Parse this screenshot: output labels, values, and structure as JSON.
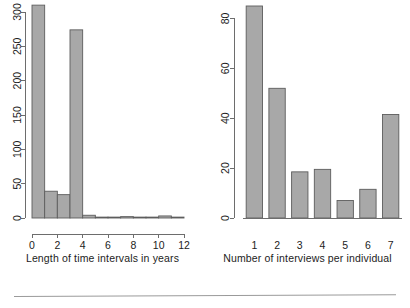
{
  "figure": {
    "background_color": "#ffffff",
    "bar_fill_color": "#a8a8a8",
    "bar_stroke_color": "#5d5d5d",
    "axis_color": "#6d6d6d",
    "footer_rule_color": "#9a9a9a"
  },
  "chart_data": [
    {
      "type": "bar",
      "title": "",
      "xlabel": "Length of time intervals in years",
      "ylabel": "",
      "xlim": [
        0,
        12
      ],
      "ylim": [
        0,
        310
      ],
      "xticks": [
        "0",
        "2",
        "4",
        "6",
        "8",
        "10",
        "12"
      ],
      "xtick_values": [
        0,
        2,
        4,
        6,
        8,
        10,
        12
      ],
      "yticks": [
        "0",
        "50",
        "100",
        "150",
        "200",
        "250",
        "300"
      ],
      "ytick_values": [
        0,
        50,
        100,
        150,
        200,
        250,
        300
      ],
      "grid": false,
      "legend": "none",
      "bin_width": 1,
      "bin_edges": [
        0,
        1,
        2,
        3,
        4,
        5,
        6,
        7,
        8,
        9,
        10,
        11,
        12
      ],
      "categories": [
        "0-1",
        "1-2",
        "2-3",
        "3-4",
        "4-5",
        "5-6",
        "6-7",
        "7-8",
        "8-9",
        "9-10",
        "10-11",
        "11-12"
      ],
      "values": [
        310,
        39,
        34,
        274,
        4,
        0,
        0,
        2,
        0,
        0,
        3,
        1
      ]
    },
    {
      "type": "bar",
      "title": "",
      "xlabel": "Number of interviews per individual",
      "ylabel": "",
      "xlim": [
        0.5,
        7.5
      ],
      "ylim": [
        0,
        85
      ],
      "xticks": [
        "1",
        "2",
        "3",
        "4",
        "5",
        "6",
        "7"
      ],
      "xtick_values": [
        1,
        2,
        3,
        4,
        5,
        6,
        7
      ],
      "yticks": [
        "0",
        "20",
        "40",
        "60",
        "80"
      ],
      "ytick_values": [
        0,
        20,
        40,
        60,
        80
      ],
      "grid": false,
      "legend": "none",
      "note": "first bar is clipped at the top edge of the figure",
      "categories": [
        "1",
        "2",
        "3",
        "4",
        "5",
        "6",
        "7"
      ],
      "values": [
        85,
        52,
        18.5,
        19.5,
        7,
        11.5,
        41.5
      ]
    }
  ],
  "panels": {
    "left": {
      "name": "length-of-time-intervals-histogram",
      "axis_title": "Length of time intervals in years"
    },
    "right": {
      "name": "number-of-interviews-barplot",
      "axis_title": "Number of interviews per individual"
    }
  }
}
